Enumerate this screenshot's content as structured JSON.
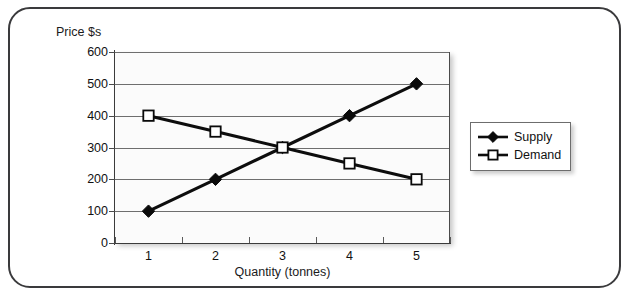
{
  "frame": {
    "name": "rounded-border-frame"
  },
  "chart_data": {
    "type": "line",
    "title": "",
    "xlabel": "Quantity (tonnes)",
    "ylabel": "Price $s",
    "categories": [
      "1",
      "2",
      "3",
      "4",
      "5"
    ],
    "x": [
      1,
      2,
      3,
      4,
      5
    ],
    "series": [
      {
        "name": "Supply",
        "values": [
          100,
          200,
          300,
          400,
          500
        ],
        "marker": "filled-diamond",
        "color": "#0a0a0a"
      },
      {
        "name": "Demand",
        "values": [
          400,
          350,
          300,
          250,
          200
        ],
        "marker": "hollow-square",
        "color": "#0a0a0a"
      }
    ],
    "ylim": [
      0,
      600
    ],
    "ytick_values": [
      0,
      100,
      200,
      300,
      400,
      500,
      600
    ],
    "ytick_labels": [
      "0",
      "100",
      "200",
      "300",
      "400",
      "500",
      "600"
    ],
    "grid": true,
    "grid_axis": "y",
    "legend_position": "right",
    "legend_entries": [
      "Supply",
      "Demand"
    ],
    "plot_background": "#fbfbfb",
    "gridline_color": "#6e6e6e",
    "axis_color": "#3b3b3b",
    "equilibrium": {
      "x": 3,
      "y": 300
    }
  },
  "legend": {
    "items": [
      {
        "label": "Supply",
        "marker": "filled-diamond"
      },
      {
        "label": "Demand",
        "marker": "hollow-square"
      }
    ]
  }
}
